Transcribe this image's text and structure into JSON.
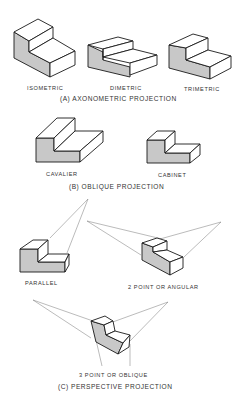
{
  "sections": [
    {
      "title": "(A) AXONOMETRIC PROJECTION",
      "views": [
        {
          "label": "ISOMETRIC"
        },
        {
          "label": "DIMETRIC"
        },
        {
          "label": "TRIMETRIC"
        }
      ]
    },
    {
      "title": "(B) OBLIQUE PROJECTION",
      "views": [
        {
          "label": "CAVALIER"
        },
        {
          "label": "CABINET"
        }
      ]
    },
    {
      "title": "(C) PERSPECTIVE PROJECTION",
      "views": [
        {
          "label": "PARALLEL"
        },
        {
          "label": "2 POINT OR ANGULAR"
        },
        {
          "label": "3 POINT OR OBLIQUE"
        }
      ]
    }
  ],
  "colors": {
    "shaded_face": "#c8c8c8",
    "line": "#1a1a1a",
    "projection_line": "#777777"
  }
}
